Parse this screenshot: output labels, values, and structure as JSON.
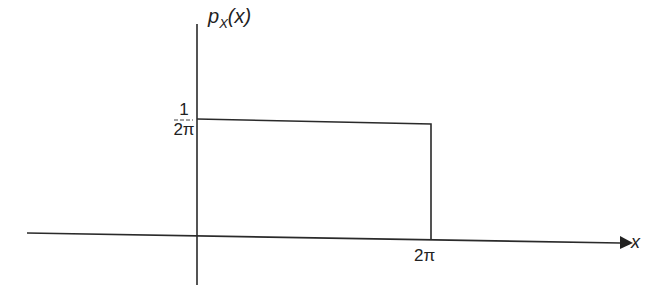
{
  "diagram": {
    "type": "uniform-pdf-plot",
    "y_axis_label": {
      "main": "p",
      "sub": "X",
      "arg": "(x)"
    },
    "x_axis_label": "x",
    "y_tick": {
      "numerator": "1",
      "denominator": "2π"
    },
    "x_tick": "2π",
    "rectangle": {
      "x_from": "0",
      "x_to": "2π",
      "height": "1/(2π)"
    },
    "line_color": "#222222"
  }
}
